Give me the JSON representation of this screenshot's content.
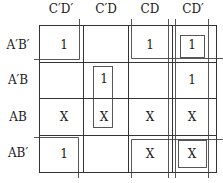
{
  "kmap": {
    "columns": [
      "C′D′",
      "C′D",
      "CD",
      "CD′"
    ],
    "rows": [
      "A′B′",
      "A′B",
      "AB",
      "AB′"
    ],
    "cells": [
      [
        "1",
        "",
        "1",
        "1"
      ],
      [
        "",
        "1",
        "",
        "1"
      ],
      [
        "X",
        "X",
        "X",
        "X"
      ],
      [
        "1",
        "",
        "X",
        "X"
      ]
    ]
  }
}
